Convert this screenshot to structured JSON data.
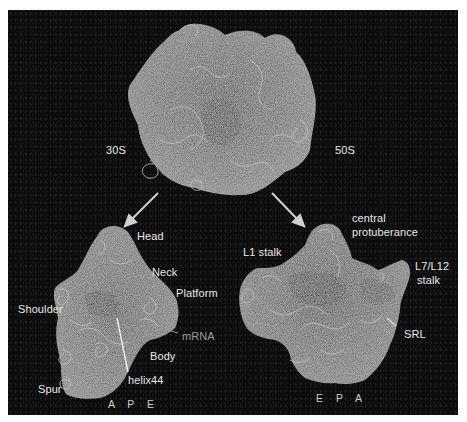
{
  "figure": {
    "background_color": "#0c0c0c",
    "label_color": "#e8e8e8",
    "mrna_label_color": "#9a9a9a",
    "top": {
      "label_left": "30S",
      "label_right": "50S"
    },
    "small_subunit": {
      "labels": {
        "head": "Head",
        "neck": "Neck",
        "platform": "Platform",
        "shoulder": "Shoulder",
        "mrna": "mRNA",
        "body": "Body",
        "helix44": "helix44",
        "spur": "Spur",
        "sites": "A P E"
      }
    },
    "large_subunit": {
      "labels": {
        "central_line1": "central",
        "central_line2": "protuberance",
        "l1_stalk": "L1 stalk",
        "l7_line1": "L7/L12",
        "l7_line2": "stalk",
        "srl": "SRL",
        "sites": "E P A"
      }
    }
  }
}
